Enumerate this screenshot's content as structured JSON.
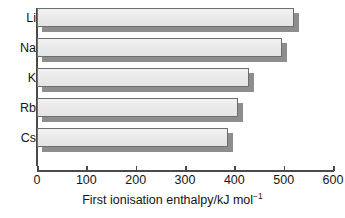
{
  "chart_data": {
    "type": "bar",
    "orientation": "horizontal",
    "title": "",
    "xlabel": "First ionisation enthalpy/kJ mol⁻¹",
    "xlabel_text": "First ionisation enthalpy/kJ mol",
    "xlabel_sup": "−1",
    "ylabel": "",
    "categories": [
      "Li",
      "Na",
      "K",
      "Rb",
      "Cs"
    ],
    "values": [
      520,
      496,
      430,
      408,
      387
    ],
    "xlim": [
      0,
      600
    ],
    "ylim": null,
    "xticks": [
      0,
      100,
      200,
      300,
      400,
      500,
      600
    ],
    "xtick_labels": [
      "0",
      "100",
      "200",
      "300",
      "400",
      "500",
      "600"
    ],
    "grid": false,
    "legend": null,
    "legend_position": "none",
    "bar_style": "3d-drop-shadow",
    "colors": {
      "bar_face": "#ebebeb",
      "bar_border": "#6e6e6e",
      "bar_shadow": "#8d8d8d",
      "axis": "#4a4a4a",
      "text": "#141414",
      "background": "#ffffff"
    }
  }
}
